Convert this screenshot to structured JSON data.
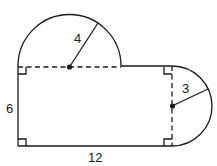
{
  "figure": {
    "labels": {
      "top_radius": "4",
      "right_radius": "3",
      "height": "6",
      "width": "12"
    },
    "colors": {
      "stroke": "#1a1a1a",
      "background": "#ffffff"
    }
  }
}
